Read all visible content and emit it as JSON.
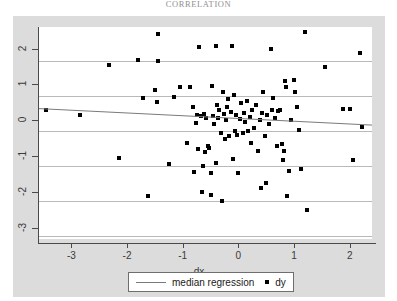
{
  "page": {
    "header_caption": "CORRELATION",
    "background_color": "#ffffff",
    "panel_color": "#dcdcdc",
    "plot_color": "#ffffff"
  },
  "legend": {
    "line_entry": "median regression",
    "marker_entry": "dy",
    "line_color": "#7a7a7a",
    "marker_color": "#000000"
  },
  "axes": {
    "x_label": "dx",
    "y_label": "",
    "x_ticks": [
      "-3",
      "-2",
      "-1",
      "0",
      "1",
      "2"
    ],
    "y_ticks": [
      "2",
      "1",
      "0",
      "-1",
      "-2",
      "-3"
    ]
  },
  "chart_data": {
    "type": "scatter",
    "title": "",
    "xlabel": "dx",
    "ylabel": "",
    "xlim": [
      -3.6,
      2.4
    ],
    "ylim": [
      -3.3,
      2.6
    ],
    "xticks": [
      -3,
      -2,
      -1,
      0,
      1,
      2
    ],
    "yticks": [
      -3,
      -2,
      -1,
      0,
      1,
      2
    ],
    "grid": true,
    "grid_axis": "y",
    "legend_position": "below-center",
    "series": [
      {
        "name": "dy",
        "type": "scatter",
        "marker": "square",
        "color": "#000000",
        "points": [
          [
            -3.45,
            0.3
          ],
          [
            -2.85,
            0.15
          ],
          [
            -2.32,
            1.55
          ],
          [
            -2.14,
            -1.05
          ],
          [
            -1.8,
            1.68
          ],
          [
            -1.72,
            0.62
          ],
          [
            -1.62,
            -2.1
          ],
          [
            -1.49,
            0.85
          ],
          [
            -1.47,
            0.52
          ],
          [
            -1.45,
            1.65
          ],
          [
            -1.44,
            2.4
          ],
          [
            -1.25,
            -1.22
          ],
          [
            -1.16,
            0.66
          ],
          [
            -1.05,
            0.94
          ],
          [
            -0.93,
            -0.62
          ],
          [
            -0.87,
            0.92
          ],
          [
            -0.82,
            0.38
          ],
          [
            -0.8,
            -1.43
          ],
          [
            -0.77,
            -0.06
          ],
          [
            -0.74,
            0.14
          ],
          [
            -0.72,
            -0.8
          ],
          [
            -0.7,
            2.05
          ],
          [
            -0.68,
            0.11
          ],
          [
            -0.66,
            -2.0
          ],
          [
            -0.64,
            -1.28
          ],
          [
            -0.62,
            0.18
          ],
          [
            -0.6,
            -0.88
          ],
          [
            -0.58,
            0.07
          ],
          [
            -0.55,
            -0.7
          ],
          [
            -0.52,
            -0.78
          ],
          [
            -0.5,
            -1.46
          ],
          [
            -0.49,
            -2.07
          ],
          [
            -0.47,
            0.95
          ],
          [
            -0.45,
            0.12
          ],
          [
            -0.43,
            -0.1
          ],
          [
            -0.41,
            -1.18
          ],
          [
            -0.4,
            2.07
          ],
          [
            -0.38,
            0.42
          ],
          [
            -0.36,
            0.08
          ],
          [
            -0.34,
            0.3
          ],
          [
            -0.32,
            -0.35
          ],
          [
            -0.3,
            -2.25
          ],
          [
            -0.28,
            0.8
          ],
          [
            -0.26,
            0.18
          ],
          [
            -0.24,
            -0.52
          ],
          [
            -0.22,
            0.02
          ],
          [
            -0.2,
            0.36
          ],
          [
            -0.18,
            0.6
          ],
          [
            -0.16,
            -0.44
          ],
          [
            -0.14,
            0.24
          ],
          [
            -0.12,
            2.07
          ],
          [
            -0.1,
            -1.08
          ],
          [
            -0.08,
            0.7
          ],
          [
            -0.06,
            -0.3
          ],
          [
            -0.04,
            0.14
          ],
          [
            -0.02,
            -0.4
          ],
          [
            0.0,
            -1.46
          ],
          [
            0.02,
            0.04
          ],
          [
            0.05,
            0.48
          ],
          [
            0.08,
            -0.36
          ],
          [
            0.1,
            0.22
          ],
          [
            0.12,
            -0.04
          ],
          [
            0.15,
            0.55
          ],
          [
            0.18,
            -0.3
          ],
          [
            0.2,
            0.1
          ],
          [
            0.22,
            -0.62
          ],
          [
            0.25,
            0.3
          ],
          [
            0.28,
            -0.22
          ],
          [
            0.32,
            0.44
          ],
          [
            0.35,
            -0.84
          ],
          [
            0.38,
            0.02
          ],
          [
            0.4,
            -1.88
          ],
          [
            0.42,
            0.2
          ],
          [
            0.45,
            0.78
          ],
          [
            0.48,
            -0.44
          ],
          [
            0.5,
            -1.75
          ],
          [
            0.52,
            0.16
          ],
          [
            0.55,
            -0.1
          ],
          [
            0.58,
            2.0
          ],
          [
            0.6,
            0.3
          ],
          [
            0.62,
            0.62
          ],
          [
            0.66,
            0.08
          ],
          [
            0.7,
            -0.72
          ],
          [
            0.72,
            0.25
          ],
          [
            0.75,
            0.28
          ],
          [
            0.78,
            -0.66
          ],
          [
            0.8,
            -1.1
          ],
          [
            0.82,
            -0.86
          ],
          [
            0.84,
            1.1
          ],
          [
            0.86,
            0.92
          ],
          [
            0.88,
            -2.1
          ],
          [
            0.9,
            -1.42
          ],
          [
            0.95,
            0.0
          ],
          [
            1.0,
            1.12
          ],
          [
            1.02,
            0.78
          ],
          [
            1.05,
            0.36
          ],
          [
            1.08,
            -0.28
          ],
          [
            1.12,
            -1.36
          ],
          [
            1.2,
            2.45
          ],
          [
            1.24,
            -2.48
          ],
          [
            1.55,
            1.48
          ],
          [
            1.88,
            0.32
          ],
          [
            2.0,
            0.33
          ],
          [
            2.05,
            -1.1
          ],
          [
            2.18,
            1.88
          ],
          [
            2.22,
            -0.18
          ]
        ]
      },
      {
        "name": "median regression",
        "type": "line",
        "color": "#7a7a7a",
        "x": [
          -3.6,
          2.4
        ],
        "y": [
          0.33,
          -0.13
        ]
      }
    ]
  }
}
